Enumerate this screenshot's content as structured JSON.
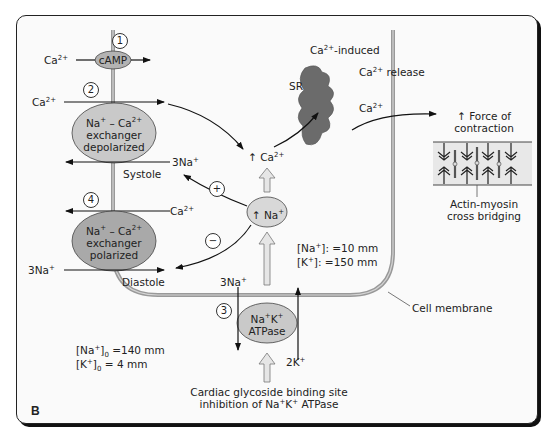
{
  "figure": {
    "panel_label": "B",
    "colors": {
      "background": "#fafafa",
      "membrane": "#999999",
      "membrane_light": "#cfcfcf",
      "oval_fill": "#c9c9c9",
      "oval_dark_fill": "#a9a9a9",
      "sr_fill": "#6b6b6b",
      "arrow": "#111111",
      "hollow_arrow_fill": "#e6e6e6",
      "sarcomere_band": "#e8e8e8"
    },
    "steps": {
      "step1": {
        "number": "1",
        "ion_in": "Ca",
        "ion_in_charge": "2+",
        "channel": "cAMP"
      },
      "step2": {
        "number": "2",
        "ion_in": "Ca",
        "ion_in_charge": "2+",
        "exchanger_line1_a": "Na",
        "exchanger_line1_a_charge": "+",
        "exchanger_line1_sep": " – ",
        "exchanger_line1_b": "Ca",
        "exchanger_line1_b_charge": "2+",
        "exchanger_line2": "exchanger",
        "exchanger_line3": "depolarized",
        "ion_out": "3Na",
        "ion_out_charge": "+",
        "phase": "Systole"
      },
      "step3": {
        "number": "3",
        "pump_line1": "Na",
        "pump_line1_charge": "+",
        "pump_line1_b": "K",
        "pump_line1_b_charge": "+",
        "pump_line2": "ATPase",
        "ion_out": "3Na",
        "ion_out_charge": "+",
        "ion_in": "2K",
        "ion_in_charge": "+"
      },
      "step4": {
        "number": "4",
        "ion_out": "Ca",
        "ion_out_charge": "2+",
        "exchanger_line1_a": "Na",
        "exchanger_line1_a_charge": "+",
        "exchanger_line1_sep": " – ",
        "exchanger_line1_b": "Ca",
        "exchanger_line1_b_charge": "2+",
        "exchanger_line2": "exchanger",
        "exchanger_line3": "polarized",
        "ion_in": "3Na",
        "ion_in_charge": "+",
        "phase": "Diastole"
      }
    },
    "center": {
      "na_up_arrow": "↑",
      "na_label": "Na",
      "na_charge": "+",
      "ca_up_arrow": "↑",
      "ca_label": "Ca",
      "ca_charge": "2+",
      "plus_sign": "+",
      "minus_sign": "−"
    },
    "sr": {
      "label": "SR",
      "induced_label_ion": "Ca",
      "induced_label_charge": "2+",
      "induced_label_text": "-induced",
      "release_ion": "Ca",
      "release_charge": "2+",
      "release_text": " release",
      "out_ion": "Ca",
      "out_charge": "2+"
    },
    "force": {
      "arrow": "↑",
      "line1": " Force of",
      "line2": "contraction",
      "cross_label_line1": "Actin-myosin",
      "cross_label_line2": "cross bridging"
    },
    "intracellular": {
      "na_line_a": "[Na",
      "na_charge": "+",
      "na_line_b": "]",
      "na_sub": "i",
      "na_value": ": =10 mm",
      "k_line_a": "[K",
      "k_charge": "+",
      "k_line_b": "]",
      "k_sub": "i",
      "k_value": ": =150 mm"
    },
    "extracellular": {
      "na_line_a": "[Na",
      "na_charge": "+",
      "na_line_b": "]",
      "na_sub": "0",
      "na_value": " =140 mm",
      "k_line_a": "[K",
      "k_charge": "+",
      "k_line_b": "]",
      "k_sub": "0",
      "k_value": " = 4 mm"
    },
    "membrane_label": "Cell membrane",
    "glycoside": {
      "line1": "Cardiac glycoside binding site",
      "line2_a": "inhibition of Na",
      "line2_charge1": "+",
      "line2_b": "K",
      "line2_charge2": "+",
      "line2_c": " ATPase"
    }
  }
}
